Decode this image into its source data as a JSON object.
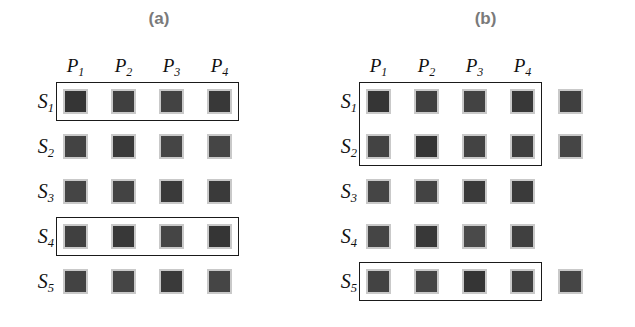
{
  "figure": {
    "background_color": "#ffffff",
    "cell_fill_color": "#3f3f3f",
    "cell_border_color": "#c9c9c9",
    "highlight_border_color": "#1a1a1a",
    "caption_color": "#7a7a7a",
    "label_color": "#111111"
  },
  "panels": [
    {
      "id": "a",
      "caption": "(a)",
      "column_headers": [
        {
          "text": "P",
          "sub": "1"
        },
        {
          "text": "P",
          "sub": "2"
        },
        {
          "text": "P",
          "sub": "3"
        },
        {
          "text": "P",
          "sub": "4"
        }
      ],
      "row_labels": [
        {
          "text": "S",
          "sub": "1"
        },
        {
          "text": "S",
          "sub": "2"
        },
        {
          "text": "S",
          "sub": "3"
        },
        {
          "text": "S",
          "sub": "4"
        },
        {
          "text": "S",
          "sub": "5"
        }
      ],
      "cells": [
        [
          1,
          1,
          1,
          1,
          0
        ],
        [
          1,
          1,
          1,
          1,
          0
        ],
        [
          1,
          1,
          1,
          1,
          0
        ],
        [
          1,
          1,
          1,
          1,
          0
        ],
        [
          1,
          1,
          1,
          1,
          0
        ]
      ],
      "cell_shades": [
        [
          "#353535",
          "#404040",
          "#434343",
          "#383838",
          ""
        ],
        [
          "#434343",
          "#3a3a3a",
          "#454545",
          "#454545",
          ""
        ],
        [
          "#454545",
          "#434343",
          "#3a3a3a",
          "#3a3a3a",
          ""
        ],
        [
          "#404040",
          "#383838",
          "#454545",
          "#353535",
          ""
        ],
        [
          "#434343",
          "#454545",
          "#3a3a3a",
          "#454545",
          ""
        ]
      ],
      "highlights": [
        {
          "name": "row-s1-highlight",
          "row_start": 0,
          "row_end": 0,
          "col_start": 0,
          "col_end": 3
        },
        {
          "name": "row-s4-highlight",
          "row_start": 3,
          "row_end": 3,
          "col_start": 0,
          "col_end": 3
        }
      ]
    },
    {
      "id": "b",
      "caption": "(b)",
      "column_headers": [
        {
          "text": "P",
          "sub": "1"
        },
        {
          "text": "P",
          "sub": "2"
        },
        {
          "text": "P",
          "sub": "3"
        },
        {
          "text": "P",
          "sub": "4"
        }
      ],
      "row_labels": [
        {
          "text": "S",
          "sub": "1"
        },
        {
          "text": "S",
          "sub": "2"
        },
        {
          "text": "S",
          "sub": "3"
        },
        {
          "text": "S",
          "sub": "4"
        },
        {
          "text": "S",
          "sub": "5"
        }
      ],
      "cells": [
        [
          1,
          1,
          1,
          1,
          1
        ],
        [
          1,
          1,
          1,
          1,
          1
        ],
        [
          1,
          1,
          1,
          1,
          0
        ],
        [
          1,
          1,
          1,
          1,
          0
        ],
        [
          1,
          1,
          1,
          1,
          1
        ]
      ],
      "cell_shades": [
        [
          "#353535",
          "#404040",
          "#434343",
          "#383838",
          "#3f3f3f"
        ],
        [
          "#434343",
          "#353535",
          "#434343",
          "#3f3f3f",
          "#454545"
        ],
        [
          "#454545",
          "#434343",
          "#3a3a3a",
          "#3a3a3a",
          ""
        ],
        [
          "#454545",
          "#383838",
          "#4a4a4a",
          "#404040",
          ""
        ],
        [
          "#434343",
          "#454545",
          "#353535",
          "#404040",
          "#454545"
        ]
      ],
      "highlights": [
        {
          "name": "rows-s1-s2-highlight",
          "row_start": 0,
          "row_end": 1,
          "col_start": 0,
          "col_end": 3
        },
        {
          "name": "row-s5-highlight",
          "row_start": 4,
          "row_end": 4,
          "col_start": 0,
          "col_end": 3
        }
      ]
    }
  ],
  "geometry": {
    "cell_size": 25,
    "col_pitch": 48,
    "row_pitch": 45,
    "panel_a_first_col_x": 63,
    "panel_b_first_col_x": 48,
    "first_row_y": 89,
    "row_label_x_a": 20,
    "row_label_x_b": 5
  }
}
